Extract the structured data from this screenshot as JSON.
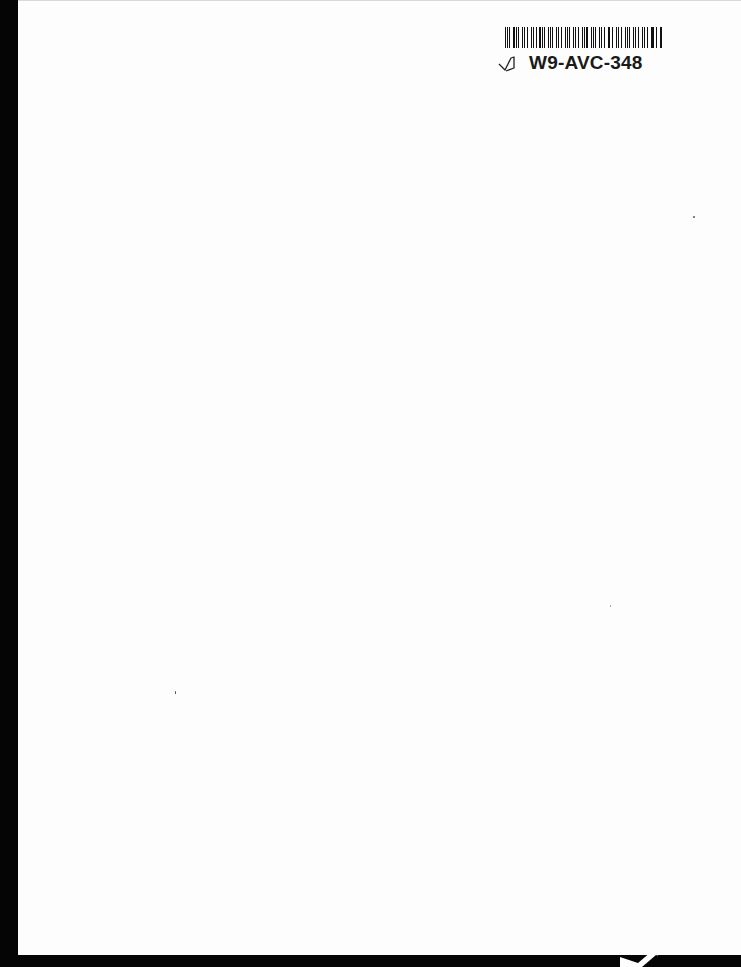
{
  "document": {
    "type": "scanned blank page",
    "barcode_label": {
      "code": "W9-AVC-348",
      "icon": "pencil-check-mark-icon",
      "bars": [
        2,
        1,
        2,
        3,
        1,
        1,
        3,
        2,
        1,
        2,
        2,
        1,
        3,
        1,
        2,
        1,
        1,
        2,
        3,
        1,
        2,
        2,
        1,
        1,
        3,
        2,
        1,
        2,
        1,
        3,
        2,
        1,
        1,
        2,
        2,
        3,
        1,
        2,
        1,
        2,
        3,
        1,
        2,
        1,
        2,
        2,
        1,
        3,
        1,
        2,
        2,
        1,
        3,
        2,
        1,
        2
      ]
    },
    "colors": {
      "page": "#fdfdfd",
      "scan_border": "#050505",
      "ink": "#111111"
    }
  }
}
